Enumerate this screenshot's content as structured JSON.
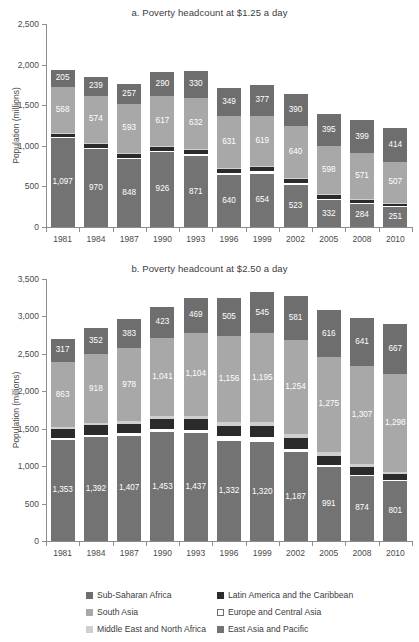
{
  "figure": {
    "ylabel": "Population (millions)"
  },
  "legend": {
    "items": [
      {
        "label": "Sub-Saharan Africa",
        "color": "#6e6e6e",
        "key": "ssa"
      },
      {
        "label": "Latin America and the Caribbean",
        "color": "#2b2b2b",
        "key": "lac"
      },
      {
        "label": "South Asia",
        "color": "#a8a8a8",
        "key": "sa"
      },
      {
        "label": "Europe and Central Asia",
        "color": "#ffffff",
        "key": "eca"
      },
      {
        "label": "Middle East and North Africa",
        "color": "#cfcfcf",
        "key": "mena"
      },
      {
        "label": "East Asia and Pacific",
        "color": "#737373",
        "key": "eap"
      }
    ]
  },
  "chart_data": [
    {
      "id": "a",
      "type": "bar",
      "subtype": "stacked-vertical",
      "title": "a. Poverty headcount at $1.25 a day",
      "xlabel": "",
      "ylabel": "Population (millions)",
      "ylim": [
        0,
        2500
      ],
      "yticks": [
        0,
        500,
        1000,
        1500,
        2000,
        2500
      ],
      "ytick_labels": [
        "0",
        "500",
        "1,000",
        "1,500",
        "2,000",
        "2,500"
      ],
      "grid": false,
      "legend_position": "below-figure",
      "categories": [
        "1981",
        "1984",
        "1987",
        "1990",
        "1993",
        "1996",
        "1999",
        "2002",
        "2005",
        "2008",
        "2010"
      ],
      "stack_order_bottom_to_top": [
        "eap",
        "eca",
        "lac",
        "mena",
        "sa",
        "ssa"
      ],
      "series": [
        {
          "name": "East Asia and Pacific",
          "key": "eap",
          "color": "#737373",
          "values": [
            1097,
            970,
            848,
            926,
            871,
            640,
            654,
            523,
            332,
            284,
            251
          ],
          "labels": [
            "1,097",
            "970",
            "848",
            "926",
            "871",
            "640",
            "654",
            "523",
            "332",
            "284",
            "251"
          ]
        },
        {
          "name": "Europe and Central Asia",
          "key": "eca",
          "color": "#ffffff",
          "values": [
            8,
            8,
            8,
            10,
            24,
            26,
            32,
            20,
            10,
            6,
            5
          ],
          "labels": [
            "",
            "",
            "",
            "",
            "",
            "",
            "",
            "",
            "",
            "",
            ""
          ]
        },
        {
          "name": "Latin America and the Caribbean",
          "key": "lac",
          "color": "#2b2b2b",
          "values": [
            45,
            48,
            50,
            52,
            54,
            54,
            56,
            57,
            52,
            44,
            35
          ],
          "labels": [
            "",
            "",
            "",
            "",
            "",
            "",
            "",
            "",
            "",
            "",
            ""
          ]
        },
        {
          "name": "Middle East and North Africa",
          "key": "mena",
          "color": "#cfcfcf",
          "values": [
            13,
            12,
            12,
            12,
            12,
            11,
            11,
            10,
            10,
            9,
            9
          ],
          "labels": [
            "",
            "",
            "",
            "",
            "",
            "",
            "",
            "",
            "",
            "",
            ""
          ]
        },
        {
          "name": "South Asia",
          "key": "sa",
          "color": "#a8a8a8",
          "values": [
            568,
            574,
            593,
            617,
            632,
            631,
            619,
            640,
            598,
            571,
            507
          ],
          "labels": [
            "568",
            "574",
            "593",
            "617",
            "632",
            "631",
            "619",
            "640",
            "598",
            "571",
            "507"
          ]
        },
        {
          "name": "Sub-Saharan Africa",
          "key": "ssa",
          "color": "#6e6e6e",
          "values": [
            205,
            239,
            257,
            290,
            330,
            349,
            377,
            390,
            395,
            399,
            414
          ],
          "labels": [
            "205",
            "239",
            "257",
            "290",
            "330",
            "349",
            "377",
            "390",
            "395",
            "399",
            "414"
          ]
        }
      ]
    },
    {
      "id": "b",
      "type": "bar",
      "subtype": "stacked-vertical",
      "title": "b. Poverty headcount at $2.50 a day",
      "xlabel": "",
      "ylabel": "Population (millions)",
      "ylim": [
        0,
        3500
      ],
      "yticks": [
        0,
        500,
        1000,
        1500,
        2000,
        2500,
        3000,
        3500
      ],
      "ytick_labels": [
        "0",
        "500",
        "1,000",
        "1,500",
        "2,000",
        "2,500",
        "3,000",
        "3,500"
      ],
      "grid": false,
      "legend_position": "below-figure",
      "categories": [
        "1981",
        "1984",
        "1987",
        "1990",
        "1993",
        "1996",
        "1999",
        "2002",
        "2005",
        "2008",
        "2010"
      ],
      "stack_order_bottom_to_top": [
        "eap",
        "eca",
        "lac",
        "mena",
        "sa",
        "ssa"
      ],
      "series": [
        {
          "name": "East Asia and Pacific",
          "key": "eap",
          "color": "#737373",
          "values": [
            1353,
            1392,
            1407,
            1453,
            1437,
            1332,
            1320,
            1187,
            991,
            874,
            801
          ],
          "labels": [
            "1,353",
            "1,392",
            "1,407",
            "1,453",
            "1,437",
            "1,332",
            "1,320",
            "1,187",
            "991",
            "874",
            "801"
          ]
        },
        {
          "name": "Europe and Central Asia",
          "key": "eca",
          "color": "#ffffff",
          "values": [
            26,
            28,
            30,
            38,
            52,
            68,
            72,
            44,
            22,
            12,
            10
          ],
          "labels": [
            "",
            "",
            "",
            "",
            "",
            "",
            "",
            "",
            "",
            "",
            ""
          ]
        },
        {
          "name": "Latin America and the Caribbean",
          "key": "lac",
          "color": "#2b2b2b",
          "values": [
            118,
            124,
            128,
            134,
            138,
            134,
            140,
            148,
            126,
            102,
            78
          ],
          "labels": [
            "",
            "",
            "",
            "",
            "",
            "",
            "",
            "",
            "",
            "",
            ""
          ]
        },
        {
          "name": "Middle East and North Africa",
          "key": "mena",
          "color": "#cfcfcf",
          "values": [
            28,
            30,
            34,
            42,
            48,
            50,
            52,
            54,
            50,
            44,
            40
          ],
          "labels": [
            "",
            "",
            "",
            "",
            "",
            "",
            "",
            "",
            "",
            "",
            ""
          ]
        },
        {
          "name": "South Asia",
          "key": "sa",
          "color": "#a8a8a8",
          "values": [
            863,
            918,
            978,
            1041,
            1104,
            1156,
            1195,
            1254,
            1275,
            1307,
            1298
          ],
          "labels": [
            "863",
            "918",
            "978",
            "1,041",
            "1,104",
            "1,156",
            "1,195",
            "1,254",
            "1,275",
            "1,307",
            "1,298"
          ]
        },
        {
          "name": "Sub-Saharan Africa",
          "key": "ssa",
          "color": "#6e6e6e",
          "values": [
            317,
            352,
            383,
            423,
            469,
            505,
            545,
            581,
            616,
            641,
            667
          ],
          "labels": [
            "317",
            "352",
            "383",
            "423",
            "469",
            "505",
            "545",
            "581",
            "616",
            "641",
            "667"
          ]
        }
      ]
    }
  ]
}
